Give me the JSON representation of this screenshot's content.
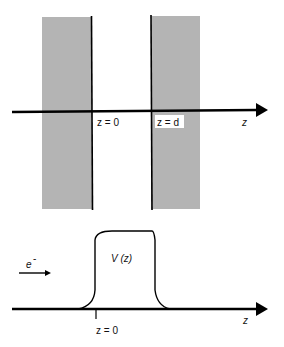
{
  "top_panel": {
    "slabs": [
      {
        "name": "left-slab",
        "x": 42,
        "y": 17,
        "width": 50,
        "height": 192,
        "color": "#b4b4b4"
      },
      {
        "name": "right-slab",
        "x": 151,
        "y": 16,
        "width": 49,
        "height": 193,
        "color": "#b4b4b4"
      }
    ],
    "interfaces": [
      {
        "name": "interface-z0",
        "x": 91,
        "y1": 16,
        "y2": 210
      },
      {
        "name": "interface-zd",
        "x": 151,
        "y1": 15,
        "y2": 210
      }
    ],
    "axis": {
      "y": 111,
      "x_start": 12,
      "x_end": 268,
      "label": "z"
    },
    "labels": {
      "z0": "z = 0",
      "zd": "z = d",
      "axis": "z"
    }
  },
  "bottom_panel": {
    "axis": {
      "y": 309,
      "x_start": 12,
      "x_end": 268,
      "label": "z"
    },
    "potential_label": "V (z)",
    "electron_label": "e",
    "electron_superscript": "-",
    "tick_label": "z = 0",
    "tick_x": 96
  },
  "colors": {
    "slab_fill": "#b4b4b4",
    "line": "#000000",
    "background": "#ffffff"
  }
}
